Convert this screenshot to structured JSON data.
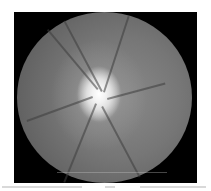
{
  "image": {
    "description": "Grayscale retinal fundus photograph centered on the optic disc",
    "subject": "optic disc",
    "background_color": "#000000",
    "page_color": "#ffffff",
    "disc_color": "#ffffff",
    "retina_color": "#767676"
  }
}
